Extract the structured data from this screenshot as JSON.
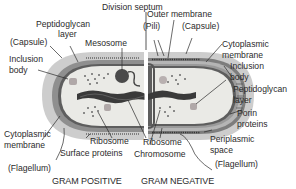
{
  "title_label": "Division septum",
  "captions": {
    "left": "GRAM POSITIVE",
    "right": "GRAM NEGATIVE"
  },
  "gram_positive_labels": {
    "peptidoglycan_1": "Peptidoglycan",
    "peptidoglycan_2": "layer",
    "capsule": "(Capsule)",
    "mesosome": "Mesosome",
    "inclusion_1": "Inclusion",
    "inclusion_2": "body",
    "cytoplasmic_1": "Cytoplasmic",
    "cytoplasmic_2": "membrane",
    "ribosome": "Ribosome",
    "surface_proteins": "Surface proteins",
    "flagellum": "(Flagellum)"
  },
  "gram_negative_labels": {
    "outer_membrane": "Outer membrane",
    "pili": "(Pili)",
    "capsule": "(Capsule)",
    "cytoplasmic_1": "Cytoplasmic",
    "cytoplasmic_2": "membrane",
    "inclusion_1": "Inclusion",
    "inclusion_2": "body",
    "peptidoglycan_1": "Peptidoglycan",
    "peptidoglycan_2": "layer",
    "porin_1": "Porin",
    "porin_2": "proteins",
    "periplasmic_1": "Periplasmic",
    "periplasmic_2": "space",
    "flagellum": "(Flagellum)",
    "ribosome": "Ribosome",
    "chromosome": "Chromosome"
  },
  "colors": {
    "capsule": "#c9c9c9",
    "wall": "#8e8e8e",
    "cytoplasm": "#e9e9e6",
    "chromosome": "#3a3a3a",
    "line": "#2b2b2b"
  }
}
